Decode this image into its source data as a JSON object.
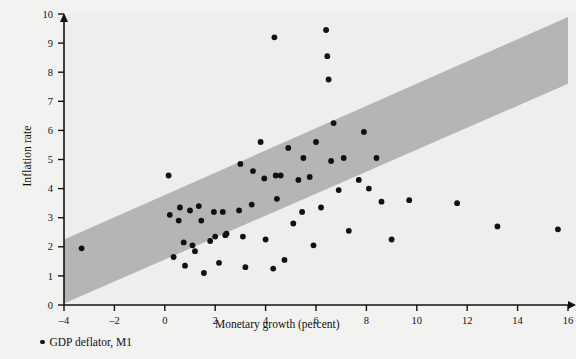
{
  "chart_data": {
    "type": "scatter",
    "title": "",
    "xlabel": "Monetary growth (percent)",
    "ylabel": "Inflation rate",
    "xlim": [
      -4,
      16
    ],
    "ylim": [
      0,
      10
    ],
    "xticks": [
      -4,
      -2,
      0,
      2,
      4,
      6,
      8,
      10,
      12,
      14,
      16
    ],
    "xtick_labels": [
      "–4",
      "–2",
      "0",
      "2",
      "4",
      "6",
      "8",
      "10",
      "12",
      "14",
      "16"
    ],
    "yticks": [
      0,
      1,
      2,
      3,
      4,
      5,
      6,
      7,
      8,
      9,
      10
    ],
    "ytick_labels": [
      "0",
      "1",
      "2",
      "3",
      "4",
      "5",
      "6",
      "7",
      "8",
      "9",
      "10"
    ],
    "grid": false,
    "legend_position": "below-left",
    "legend": [
      {
        "label": "GDP deflator, M1",
        "marker": "circle",
        "color": "#111111"
      }
    ],
    "series": [
      {
        "name": "GDP deflator, M1",
        "marker": "circle",
        "color": "#111111",
        "points": [
          [
            -3.3,
            1.95
          ],
          [
            0.15,
            4.45
          ],
          [
            0.2,
            3.1
          ],
          [
            0.35,
            1.65
          ],
          [
            0.55,
            2.9
          ],
          [
            0.6,
            3.35
          ],
          [
            0.75,
            2.15
          ],
          [
            0.8,
            1.35
          ],
          [
            1.0,
            3.25
          ],
          [
            1.1,
            2.05
          ],
          [
            1.2,
            1.85
          ],
          [
            1.35,
            3.4
          ],
          [
            1.45,
            2.9
          ],
          [
            1.55,
            1.1
          ],
          [
            1.8,
            2.2
          ],
          [
            1.95,
            3.2
          ],
          [
            2.0,
            2.35
          ],
          [
            2.15,
            1.45
          ],
          [
            2.3,
            3.2
          ],
          [
            2.4,
            2.4
          ],
          [
            2.45,
            2.45
          ],
          [
            2.95,
            3.25
          ],
          [
            3.0,
            4.85
          ],
          [
            3.1,
            2.35
          ],
          [
            3.2,
            1.3
          ],
          [
            3.45,
            3.45
          ],
          [
            3.5,
            4.6
          ],
          [
            3.8,
            5.6
          ],
          [
            3.95,
            4.35
          ],
          [
            4.0,
            2.25
          ],
          [
            4.3,
            1.25
          ],
          [
            4.35,
            9.2
          ],
          [
            4.4,
            4.45
          ],
          [
            4.45,
            3.65
          ],
          [
            4.6,
            4.45
          ],
          [
            4.75,
            1.55
          ],
          [
            4.9,
            5.4
          ],
          [
            5.1,
            2.8
          ],
          [
            5.3,
            4.3
          ],
          [
            5.45,
            3.2
          ],
          [
            5.5,
            5.05
          ],
          [
            5.75,
            4.4
          ],
          [
            5.9,
            2.05
          ],
          [
            6.0,
            5.6
          ],
          [
            6.2,
            3.35
          ],
          [
            6.4,
            9.45
          ],
          [
            6.45,
            8.55
          ],
          [
            6.5,
            7.75
          ],
          [
            6.6,
            4.95
          ],
          [
            6.7,
            6.25
          ],
          [
            6.9,
            3.95
          ],
          [
            7.1,
            5.05
          ],
          [
            7.3,
            2.55
          ],
          [
            7.7,
            4.3
          ],
          [
            7.9,
            5.95
          ],
          [
            8.1,
            4.0
          ],
          [
            8.4,
            5.05
          ],
          [
            8.6,
            3.55
          ],
          [
            9.0,
            2.25
          ],
          [
            9.7,
            3.6
          ],
          [
            11.6,
            3.5
          ],
          [
            13.2,
            2.7
          ],
          [
            15.6,
            2.6
          ]
        ]
      }
    ],
    "band": {
      "description": "shaded diagonal confidence band",
      "color": "#b5b5b5",
      "lower_at_xmin": 0.05,
      "lower_at_xmax": 7.6,
      "upper_at_xmin": 2.25,
      "upper_at_xmax": 9.9
    }
  },
  "style": {
    "background": "#f2f2f1",
    "plot_background": "#eeeeec",
    "axis_color": "#111111",
    "point_color": "#111111",
    "band_color": "#b5b5b5"
  }
}
